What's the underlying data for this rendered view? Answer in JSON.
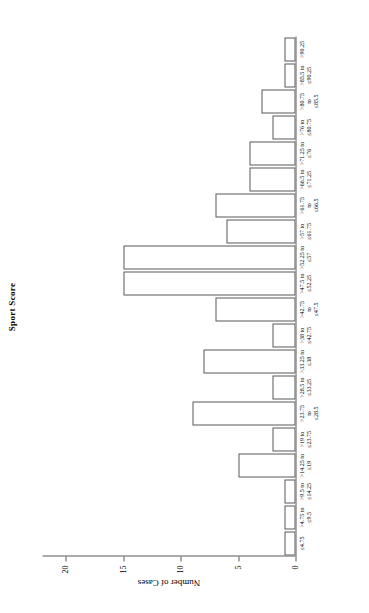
{
  "chart_data": {
    "type": "bar",
    "title": "Sport Score",
    "xlabel": "",
    "ylabel": "Number of Cases",
    "orientation": "rotated-90",
    "grid": false,
    "legend": "none",
    "ylim": [
      0,
      22
    ],
    "yticks": [
      "0",
      "5",
      "10",
      "15",
      "20"
    ],
    "ytick_values": [
      0,
      5,
      10,
      15,
      20
    ],
    "categories": [
      "≤4.75",
      ">4.75 to\n≤9.5",
      ">9.5 to\n≤14.25",
      ">14.25 to\n≤19",
      ">19 to\n≤23.75",
      ">23.75\nto\n≤28.5",
      ">28.5 to\n≤33.25",
      ">33.25 to\n≤38",
      ">38 to\n≤42.75",
      ">42.75\nto\n≤47.5",
      ">47.5 to\n≤52.25",
      ">52.25 to\n≤57",
      ">57 to\n≤61.75",
      ">61.75\nto\n≤66.5",
      ">66.5 to\n≤71.25",
      ">71.25 to\n≤76",
      ">76 to\n≤80.75",
      ">80.75\nto\n≤85.5",
      ">85.5 to\n≤90.25",
      ">90.25"
    ],
    "values": [
      1,
      1,
      1,
      5,
      2,
      9,
      2,
      8,
      2,
      7,
      15,
      15,
      6,
      7,
      4,
      4,
      2,
      3,
      1,
      1
    ]
  }
}
